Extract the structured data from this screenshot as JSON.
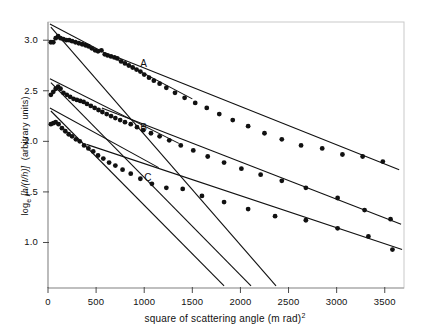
{
  "chart_data": {
    "type": "scatter",
    "title": "",
    "xlabel": "square of scattering angle (m rad)",
    "xlabel_exponent": "2",
    "ylabel_main": "log",
    "ylabel_sub": "e",
    "ylabel_bracket": "[h/(I/h)]",
    "ylabel_units": "(arbitrary units)",
    "xlim": [
      0,
      3700
    ],
    "ylim": [
      0.55,
      3.18
    ],
    "grid": false,
    "legend_position": "inline-labels",
    "xticks": [
      0,
      500,
      1000,
      1500,
      2000,
      2500,
      3000,
      3500
    ],
    "xticklabels": [
      "0",
      "500",
      "1000",
      "1500",
      "2000",
      "2500",
      "3000",
      "3500"
    ],
    "yticks": [
      1.0,
      1.5,
      2.0,
      2.5,
      3.0
    ],
    "yticklabels": [
      "1.0",
      "1.5",
      "2.0",
      "2.5",
      "3.0"
    ],
    "annotations": [
      {
        "text": "A",
        "x": 960,
        "y": 2.75
      },
      {
        "text": "B",
        "x": 960,
        "y": 2.12
      },
      {
        "text": "C",
        "x": 1000,
        "y": 1.63
      }
    ],
    "series": [
      {
        "name": "A",
        "marker": "filled-circle",
        "points": [
          [
            30,
            2.98
          ],
          [
            55,
            2.98
          ],
          [
            80,
            3.02
          ],
          [
            105,
            3.04
          ],
          [
            130,
            3.02
          ],
          [
            160,
            3.01
          ],
          [
            190,
            3.0
          ],
          [
            220,
            3.0
          ],
          [
            250,
            2.99
          ],
          [
            285,
            2.98
          ],
          [
            320,
            2.97
          ],
          [
            355,
            2.96
          ],
          [
            390,
            2.95
          ],
          [
            420,
            2.94
          ],
          [
            455,
            2.92
          ],
          [
            490,
            2.9
          ],
          [
            520,
            2.89
          ],
          [
            555,
            2.9
          ],
          [
            590,
            2.86
          ],
          [
            620,
            2.85
          ],
          [
            655,
            2.84
          ],
          [
            690,
            2.83
          ],
          [
            720,
            2.82
          ],
          [
            760,
            2.79
          ],
          [
            800,
            2.77
          ],
          [
            840,
            2.75
          ],
          [
            880,
            2.73
          ],
          [
            920,
            2.71
          ],
          [
            960,
            2.69
          ],
          [
            1000,
            2.66
          ],
          [
            1050,
            2.63
          ],
          [
            1100,
            2.6
          ],
          [
            1160,
            2.57
          ],
          [
            1230,
            2.53
          ],
          [
            1320,
            2.48
          ],
          [
            1420,
            2.43
          ],
          [
            1530,
            2.38
          ],
          [
            1650,
            2.33
          ],
          [
            1780,
            2.27
          ],
          [
            1920,
            2.21
          ],
          [
            2080,
            2.15
          ],
          [
            2250,
            2.08
          ],
          [
            2430,
            2.02
          ],
          [
            2630,
            1.96
          ],
          [
            2850,
            1.93
          ],
          [
            3060,
            1.87
          ],
          [
            3270,
            1.85
          ],
          [
            3480,
            1.8
          ]
        ],
        "fit_lines": [
          {
            "x0": 20,
            "y0": 3.16,
            "x1": 1500,
            "y1": 2.42
          },
          {
            "x0": 700,
            "y0": 2.84,
            "x1": 3650,
            "y1": 1.72
          }
        ]
      },
      {
        "name": "B",
        "marker": "filled-circle",
        "points": [
          [
            30,
            2.46
          ],
          [
            55,
            2.49
          ],
          [
            80,
            2.52
          ],
          [
            105,
            2.54
          ],
          [
            130,
            2.52
          ],
          [
            160,
            2.48
          ],
          [
            195,
            2.46
          ],
          [
            230,
            2.44
          ],
          [
            265,
            2.42
          ],
          [
            300,
            2.41
          ],
          [
            335,
            2.4
          ],
          [
            370,
            2.39
          ],
          [
            405,
            2.37
          ],
          [
            445,
            2.35
          ],
          [
            485,
            2.33
          ],
          [
            525,
            2.31
          ],
          [
            565,
            2.29
          ],
          [
            610,
            2.27
          ],
          [
            655,
            2.25
          ],
          [
            700,
            2.23
          ],
          [
            750,
            2.21
          ],
          [
            800,
            2.19
          ],
          [
            860,
            2.17
          ],
          [
            925,
            2.14
          ],
          [
            990,
            2.11
          ],
          [
            1070,
            2.08
          ],
          [
            1160,
            2.05
          ],
          [
            1260,
            2.01
          ],
          [
            1380,
            1.96
          ],
          [
            1510,
            1.91
          ],
          [
            1660,
            1.85
          ],
          [
            1830,
            1.79
          ],
          [
            2010,
            1.73
          ],
          [
            2210,
            1.67
          ],
          [
            2430,
            1.61
          ],
          [
            2680,
            1.54
          ],
          [
            3010,
            1.44
          ],
          [
            3290,
            1.32
          ],
          [
            3560,
            1.23
          ]
        ],
        "fit_lines": [
          {
            "x0": 20,
            "y0": 2.62,
            "x1": 1360,
            "y1": 1.98
          },
          {
            "x0": 560,
            "y0": 2.33,
            "x1": 3670,
            "y1": 1.18
          }
        ]
      },
      {
        "name": "C",
        "marker": "filled-circle",
        "points": [
          [
            30,
            2.17
          ],
          [
            55,
            2.18
          ],
          [
            80,
            2.19
          ],
          [
            110,
            2.17
          ],
          [
            145,
            2.13
          ],
          [
            180,
            2.1
          ],
          [
            215,
            2.07
          ],
          [
            250,
            2.05
          ],
          [
            290,
            2.02
          ],
          [
            330,
            2.0
          ],
          [
            375,
            1.96
          ],
          [
            420,
            1.93
          ],
          [
            470,
            1.9
          ],
          [
            520,
            1.86
          ],
          [
            575,
            1.83
          ],
          [
            635,
            1.79
          ],
          [
            700,
            1.76
          ],
          [
            775,
            1.72
          ],
          [
            860,
            1.68
          ],
          [
            960,
            1.63
          ],
          [
            1080,
            1.58
          ],
          [
            1230,
            1.54
          ],
          [
            1400,
            1.53
          ],
          [
            1600,
            1.46
          ],
          [
            1830,
            1.4
          ],
          [
            2080,
            1.33
          ],
          [
            2360,
            1.26
          ],
          [
            2680,
            1.22
          ],
          [
            3010,
            1.14
          ],
          [
            3330,
            1.06
          ],
          [
            3580,
            0.93
          ]
        ],
        "fit_lines": [
          {
            "x0": 20,
            "y0": 2.33,
            "x1": 1150,
            "y1": 1.74
          },
          {
            "x0": 400,
            "y0": 1.97,
            "x1": 3680,
            "y1": 0.93
          }
        ]
      }
    ],
    "steep_reference_lines": [
      {
        "x0": 30,
        "y0": 3.13,
        "x1": 2370,
        "y1": 0.57
      },
      {
        "x0": 30,
        "y0": 2.58,
        "x1": 2110,
        "y1": 0.57
      },
      {
        "x0": 30,
        "y0": 2.3,
        "x1": 1830,
        "y1": 0.57
      }
    ]
  }
}
